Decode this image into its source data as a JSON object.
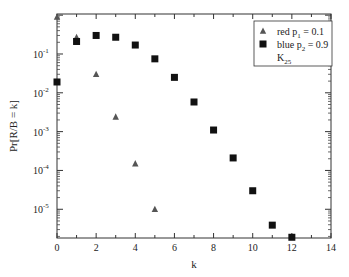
{
  "chart_data": {
    "type": "scatter",
    "title": "",
    "xlabel": "k",
    "ylabel": "Pr[R/B = k]",
    "xlim": [
      0,
      14
    ],
    "ylim_log10": [
      -5.74,
      0.03
    ],
    "yscale": "log",
    "grid": false,
    "legend_position": "upper right",
    "x_ticks": [
      0,
      2,
      4,
      6,
      8,
      10,
      12,
      14
    ],
    "y_ticks": [
      {
        "exp": -1,
        "label": "10",
        "sup": "-1"
      },
      {
        "exp": -2,
        "label": "10",
        "sup": "-2"
      },
      {
        "exp": -3,
        "label": "10",
        "sup": "-3"
      },
      {
        "exp": -4,
        "label": "10",
        "sup": "-4"
      },
      {
        "exp": -5,
        "label": "10",
        "sup": "-5"
      }
    ],
    "series": [
      {
        "name": "red p1 = 0.1",
        "legend_main": "red p",
        "legend_sub": "1",
        "legend_tail": " = 0.1",
        "marker": "triangle",
        "color": "#555555",
        "x": [
          0,
          1,
          2,
          3,
          4,
          5
        ],
        "values": [
          0.9,
          0.27,
          0.03,
          0.0024,
          0.00015,
          1e-05
        ]
      },
      {
        "name": "blue p2 = 0.9",
        "legend_main": "blue p",
        "legend_sub": "2",
        "legend_tail": " = 0.9",
        "marker": "square",
        "color": "#111111",
        "x": [
          0,
          1,
          2,
          3,
          4,
          5,
          6,
          7,
          8,
          9,
          10,
          11,
          12
        ],
        "values": [
          0.019,
          0.21,
          0.3,
          0.27,
          0.17,
          0.075,
          0.025,
          0.0058,
          0.0011,
          0.00021,
          3e-05,
          3.9e-06,
          1.9e-06
        ]
      }
    ],
    "legend_extra": {
      "main": "K",
      "sub": "25"
    }
  }
}
